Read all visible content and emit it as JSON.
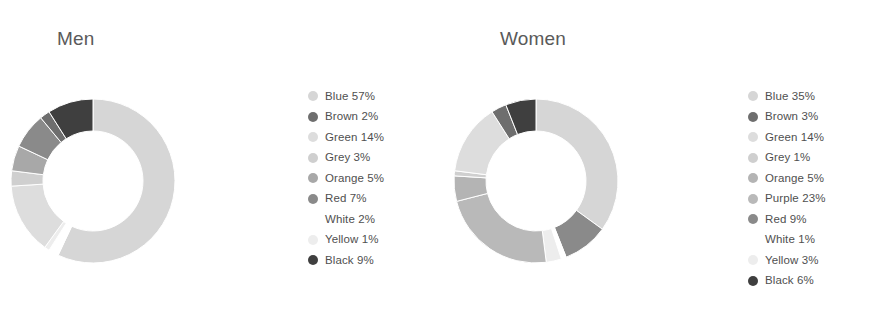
{
  "background_color": "#ffffff",
  "panels": [
    {
      "id": "men",
      "title": "Men",
      "legend": [
        {
          "label": "Blue 57%",
          "name": "Blue",
          "value": 57,
          "swatch": "#d6d6d6",
          "swatch_visible": true
        },
        {
          "label": "Brown 2%",
          "name": "Brown",
          "value": 2,
          "swatch": "#6e6e6e",
          "swatch_visible": true
        },
        {
          "label": "Green 14%",
          "name": "Green",
          "value": 14,
          "swatch": "#dddddd",
          "swatch_visible": true
        },
        {
          "label": "Grey 3%",
          "name": "Grey",
          "value": 3,
          "swatch": "#cfcfcf",
          "swatch_visible": true
        },
        {
          "label": "Orange 5%",
          "name": "Orange",
          "value": 5,
          "swatch": "#a8a8a8",
          "swatch_visible": true
        },
        {
          "label": "Red 7%",
          "name": "Red",
          "value": 7,
          "swatch": "#8a8a8a",
          "swatch_visible": true
        },
        {
          "label": "White 2%",
          "name": "White",
          "value": 2,
          "swatch": "#ffffff",
          "swatch_visible": false
        },
        {
          "label": "Yellow 1%",
          "name": "Yellow",
          "value": 1,
          "swatch": "#ededed",
          "swatch_visible": true
        },
        {
          "label": "Black 9%",
          "name": "Black",
          "value": 9,
          "swatch": "#3f3f3f",
          "swatch_visible": true
        }
      ]
    },
    {
      "id": "women",
      "title": "Women",
      "legend": [
        {
          "label": "Blue 35%",
          "name": "Blue",
          "value": 35,
          "swatch": "#d6d6d6",
          "swatch_visible": true
        },
        {
          "label": "Brown 3%",
          "name": "Brown",
          "value": 3,
          "swatch": "#6e6e6e",
          "swatch_visible": true
        },
        {
          "label": "Green 14%",
          "name": "Green",
          "value": 14,
          "swatch": "#dddddd",
          "swatch_visible": true
        },
        {
          "label": "Grey 1%",
          "name": "Grey",
          "value": 1,
          "swatch": "#cfcfcf",
          "swatch_visible": true
        },
        {
          "label": "Orange 5%",
          "name": "Orange",
          "value": 5,
          "swatch": "#b4b4b4",
          "swatch_visible": true
        },
        {
          "label": "Purple 23%",
          "name": "Purple",
          "value": 23,
          "swatch": "#b9b9b9",
          "swatch_visible": true
        },
        {
          "label": "Red 9%",
          "name": "Red",
          "value": 9,
          "swatch": "#8a8a8a",
          "swatch_visible": true
        },
        {
          "label": "White 1%",
          "name": "White",
          "value": 1,
          "swatch": "#ffffff",
          "swatch_visible": false
        },
        {
          "label": "Yellow 3%",
          "name": "Yellow",
          "value": 3,
          "swatch": "#ededed",
          "swatch_visible": true
        },
        {
          "label": "Black 6%",
          "name": "Black",
          "value": 6,
          "swatch": "#3f3f3f",
          "swatch_visible": true
        }
      ]
    }
  ],
  "chart_data": [
    {
      "type": "pie",
      "variant": "donut",
      "title": "Men",
      "categories": [
        "Blue",
        "White",
        "Yellow",
        "Green",
        "Grey",
        "Orange",
        "Red",
        "Brown",
        "Black"
      ],
      "values": [
        57,
        2,
        1,
        14,
        3,
        5,
        7,
        2,
        9
      ],
      "colors": [
        "#d6d6d6",
        "#ffffff",
        "#ededed",
        "#dddddd",
        "#cfcfcf",
        "#a8a8a8",
        "#8a8a8a",
        "#6e6e6e",
        "#3f3f3f"
      ],
      "unit": "%",
      "total": 100,
      "start_angle_deg": 0,
      "direction": "clockwise",
      "inner_radius_ratio": 0.6,
      "legend_position": "right",
      "grid": false
    },
    {
      "type": "pie",
      "variant": "donut",
      "title": "Women",
      "categories": [
        "Blue",
        "Red",
        "White",
        "Yellow",
        "Purple",
        "Orange",
        "Grey",
        "Green",
        "Brown",
        "Black"
      ],
      "values": [
        35,
        9,
        1,
        3,
        23,
        5,
        1,
        14,
        3,
        6
      ],
      "colors": [
        "#d6d6d6",
        "#8a8a8a",
        "#ffffff",
        "#ededed",
        "#b9b9b9",
        "#b4b4b4",
        "#cfcfcf",
        "#dddddd",
        "#6e6e6e",
        "#3f3f3f"
      ],
      "unit": "%",
      "total": 100,
      "start_angle_deg": 0,
      "direction": "clockwise",
      "inner_radius_ratio": 0.6,
      "legend_position": "right",
      "grid": false
    }
  ]
}
